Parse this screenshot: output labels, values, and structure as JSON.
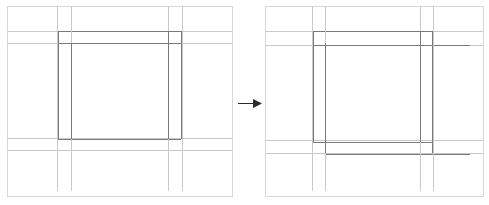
{
  "figure": {
    "kind": "line-diagram-pair",
    "background_color": "#ffffff",
    "canvas": {
      "width": 489,
      "height": 205
    },
    "caption_left": "",
    "caption_right": "",
    "transition_symbol": "arrow-right"
  },
  "colors": {
    "panel_border": "#d8d8d8",
    "line_light": "#c9c9c9",
    "line_mid": "#a8a8a8",
    "line_dark": "#7a7a7a",
    "arrow": "#2b2b2b",
    "background": "#ffffff"
  },
  "chart_data": {
    "type": "line-diagram",
    "title": "",
    "panels": [
      {
        "name": "before-panel",
        "label": "",
        "frame": {
          "x": 7,
          "y": 6,
          "width": 225,
          "height": 190
        },
        "vertical_lines": [
          {
            "id": "v1",
            "x": 57,
            "y1": 6,
            "y2": 191,
            "shade": "light",
            "width": 1
          },
          {
            "id": "v2",
            "x": 71,
            "y1": 6,
            "y2": 191,
            "shade": "light",
            "width": 1
          },
          {
            "id": "v3",
            "x": 168,
            "y1": 6,
            "y2": 191,
            "shade": "light",
            "width": 1
          },
          {
            "id": "v4",
            "x": 182,
            "y1": 6,
            "y2": 191,
            "shade": "light",
            "width": 1
          },
          {
            "id": "v5",
            "x": 58,
            "y1": 31,
            "y2": 139,
            "shade": "dark",
            "width": 1
          },
          {
            "id": "v6",
            "x": 71,
            "y1": 43,
            "y2": 139,
            "shade": "dark",
            "width": 1
          },
          {
            "id": "v7",
            "x": 168,
            "y1": 31,
            "y2": 139,
            "shade": "dark",
            "width": 1
          },
          {
            "id": "v8",
            "x": 181,
            "y1": 31,
            "y2": 139,
            "shade": "dark",
            "width": 1
          }
        ],
        "horizontal_lines": [
          {
            "id": "h1",
            "y": 31,
            "x1": 7,
            "x2": 232,
            "shade": "light",
            "width": 1
          },
          {
            "id": "h2",
            "y": 43,
            "x1": 7,
            "x2": 232,
            "shade": "light",
            "width": 1
          },
          {
            "id": "h3",
            "y": 138,
            "x1": 7,
            "x2": 232,
            "shade": "light",
            "width": 1
          },
          {
            "id": "h4",
            "y": 150,
            "x1": 7,
            "x2": 232,
            "shade": "light",
            "width": 1
          },
          {
            "id": "h5",
            "y": 31,
            "x1": 58,
            "x2": 181,
            "shade": "dark",
            "width": 1
          },
          {
            "id": "h6",
            "y": 43,
            "x1": 58,
            "x2": 181,
            "shade": "dark",
            "width": 1
          },
          {
            "id": "h7",
            "y": 139,
            "x1": 58,
            "x2": 181,
            "shade": "dark",
            "width": 1
          }
        ]
      },
      {
        "name": "after-panel",
        "label": "",
        "frame": {
          "x": 265,
          "y": 6,
          "width": 218,
          "height": 190
        },
        "vertical_lines": [
          {
            "id": "v1",
            "x": 312,
            "y1": 6,
            "y2": 191,
            "shade": "light",
            "width": 1
          },
          {
            "id": "v2",
            "x": 325,
            "y1": 6,
            "y2": 191,
            "shade": "light",
            "width": 1
          },
          {
            "id": "v3",
            "x": 420,
            "y1": 6,
            "y2": 191,
            "shade": "light",
            "width": 1
          },
          {
            "id": "v4",
            "x": 433,
            "y1": 6,
            "y2": 191,
            "shade": "light",
            "width": 1
          },
          {
            "id": "v5",
            "x": 313,
            "y1": 31,
            "y2": 142,
            "shade": "dark",
            "width": 1
          },
          {
            "id": "v6",
            "x": 325,
            "y1": 43,
            "y2": 153,
            "shade": "dark",
            "width": 1
          },
          {
            "id": "v7",
            "x": 420,
            "y1": 31,
            "y2": 142,
            "shade": "dark",
            "width": 1
          },
          {
            "id": "v8",
            "x": 432,
            "y1": 31,
            "y2": 153,
            "shade": "dark",
            "width": 1
          }
        ],
        "horizontal_lines": [
          {
            "id": "h1",
            "y": 31,
            "x1": 265,
            "x2": 483,
            "shade": "light",
            "width": 1
          },
          {
            "id": "h2",
            "y": 45,
            "x1": 265,
            "x2": 483,
            "shade": "light",
            "width": 1
          },
          {
            "id": "h3",
            "y": 140,
            "x1": 265,
            "x2": 483,
            "shade": "light",
            "width": 1
          },
          {
            "id": "h4",
            "y": 153,
            "x1": 265,
            "x2": 483,
            "shade": "light",
            "width": 1
          },
          {
            "id": "h5",
            "y": 31,
            "x1": 313,
            "x2": 432,
            "shade": "dark",
            "width": 1
          },
          {
            "id": "h6",
            "y": 45,
            "x1": 313,
            "x2": 470,
            "shade": "dark",
            "width": 1
          },
          {
            "id": "h7",
            "y": 142,
            "x1": 313,
            "x2": 432,
            "shade": "dark",
            "width": 1
          },
          {
            "id": "h8",
            "y": 154,
            "x1": 325,
            "x2": 470,
            "shade": "dark",
            "width": 1
          }
        ]
      }
    ],
    "arrow": {
      "name": "transition-arrow",
      "x1": 238,
      "x2": 262,
      "y": 103,
      "direction": "right"
    }
  }
}
